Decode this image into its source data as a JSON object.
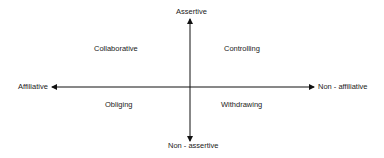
{
  "diagram": {
    "axes": {
      "vertical": {
        "top": "Assertive",
        "bottom": "Non - assertive"
      },
      "horizontal": {
        "left": "Affiliative",
        "right": "Non - affiliative"
      }
    },
    "quadrants": {
      "top_left": "Collaborative",
      "top_right": "Controlling",
      "bottom_left": "Obliging",
      "bottom_right": "Withdrawing"
    },
    "colors": {
      "line": "#111111",
      "text": "#222222",
      "background": "#ffffff"
    }
  }
}
